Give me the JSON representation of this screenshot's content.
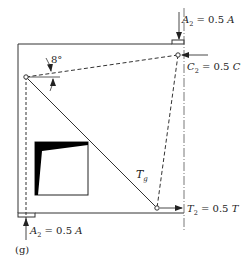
{
  "figure": {
    "panel_label": "(g)",
    "angle_label": "8°",
    "tie_label": "T",
    "tie_label_sub": "g",
    "labels": {
      "top_axial": {
        "sym": "A",
        "sub": "2",
        "eq": " = 0.5 ",
        "var": "A"
      },
      "compression": {
        "sym": "C",
        "sub": "2",
        "eq": " = 0.5 ",
        "var": "C"
      },
      "tension": {
        "sym": "T",
        "sub": "2",
        "eq": " = 0.5 ",
        "var": "T"
      },
      "bottom_axial": {
        "sym": "A",
        "sub": "2",
        "eq": " = 0.5 ",
        "var": "A"
      }
    },
    "colors": {
      "line": "#2a2a2a",
      "fill": "#000000",
      "background": "#ffffff"
    }
  }
}
